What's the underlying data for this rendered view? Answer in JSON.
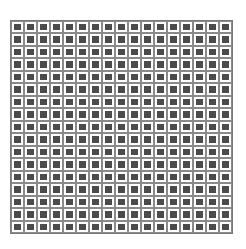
{
  "grid": {
    "rows": 17,
    "cols": 17,
    "line_color": "#8a8a8a",
    "square_color": "#4b4b4b",
    "background": "#ffffff"
  }
}
